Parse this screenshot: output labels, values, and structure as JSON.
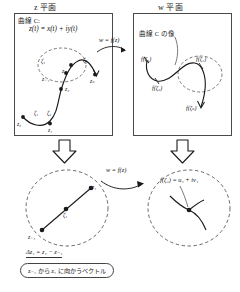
{
  "headers": {
    "left_plane": "z 平面",
    "right_plane": "w 平面"
  },
  "left_panel": {
    "caption_curve": "曲線 C:",
    "caption_param": "z(t) = x(t) + iy(t)",
    "point_labels": {
      "z0": "z₀",
      "zeta1": "ζ₁",
      "zeta2": "ζ₂",
      "z1": "z₁",
      "z2": "z₂",
      "z_j_minus_1": "z₋₁",
      "zeta_j": "ζ₁",
      "z_j": "z₁",
      "zeta_n": "ζₙ",
      "z_n": "zₙ"
    }
  },
  "right_panel": {
    "caption_image": "曲線 C の像",
    "point_labels": {
      "f_zeta1": "f(ζ₁)",
      "f_zeta2": "f(ζ₂)",
      "f_zeta_j": "f(ζ₁)",
      "f_zeta_n": "f(ζₙ)"
    }
  },
  "mapping": {
    "top_label": "w = f(z)",
    "bottom_label": "w = f(z)"
  },
  "zoom_left": {
    "z_k_minus_1": "z₋₁",
    "zeta_k": "ζ₁",
    "z_k": "z₁"
  },
  "zoom_right": {
    "equation": "f(ζ₁) = u₁ + iv₁"
  },
  "bottom": {
    "delta_equation": "Δz₁ = z₁ − z₋₁",
    "vector_note": "z₋₁ から z₁ に向かうベクトル"
  },
  "colors": {
    "ink": "#1a1a1a",
    "frame": "#4a4a4a",
    "dashed": "#555555",
    "background": "#ffffff"
  }
}
